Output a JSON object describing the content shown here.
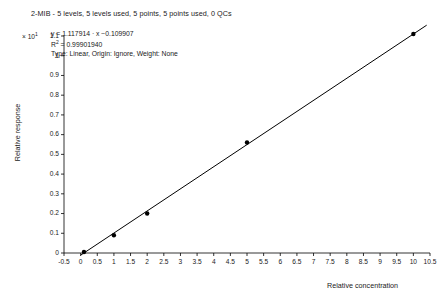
{
  "chart_data": {
    "type": "scatter",
    "title": "2-MIB - 5 levels, 5 levels used, 5 points, 5 points used, 0 QCs",
    "xlabel": "Relative concentration",
    "ylabel": "Relative response",
    "xlim": [
      -0.5,
      10.5
    ],
    "ylim": [
      0,
      1.1
    ],
    "y_axis_multiplier": "× 10",
    "y_axis_multiplier_exponent": "1",
    "grid": false,
    "legend": false,
    "x_ticks": [
      "-0.5",
      "0",
      "0.5",
      "1",
      "1.5",
      "2",
      "2.5",
      "3",
      "3.5",
      "4",
      "4.5",
      "5",
      "5.5",
      "6",
      "6.5",
      "7",
      "7.5",
      "8",
      "8.5",
      "9",
      "9.5",
      "10",
      "10.5"
    ],
    "x_tick_values": [
      -0.5,
      0,
      0.5,
      1,
      1.5,
      2,
      2.5,
      3,
      3.5,
      4,
      4.5,
      5,
      5.5,
      6,
      6.5,
      7,
      7.5,
      8,
      8.5,
      9,
      9.5,
      10,
      10.5
    ],
    "y_ticks": [
      "0",
      "0.1",
      "0.2",
      "0.3",
      "0.4",
      "0.5",
      "0.6",
      "0.7",
      "0.8",
      "0.9",
      "1",
      "1.1"
    ],
    "y_tick_values": [
      0,
      0.1,
      0.2,
      0.3,
      0.4,
      0.5,
      0.6,
      0.7,
      0.8,
      0.9,
      1.0,
      1.1
    ],
    "x": [
      0.1,
      1.0,
      2.0,
      5.0,
      10.0
    ],
    "y": [
      0.005,
      0.09,
      0.2,
      0.56,
      1.11
    ],
    "points": [
      {
        "x": 0.1,
        "y": 0.005
      },
      {
        "x": 1.0,
        "y": 0.09
      },
      {
        "x": 2.0,
        "y": 0.2
      },
      {
        "x": 5.0,
        "y": 0.56
      },
      {
        "x": 10.0,
        "y": 1.11
      }
    ],
    "fit_line": {
      "slope": 1.117914,
      "intercept": -0.109907,
      "x_start": 0.0,
      "x_end": 10.4
    },
    "annotations": {
      "equation": "y = 1.117914 · x −0.109907",
      "r_squared_label": "R",
      "r_squared_exponent": "2",
      "r_squared_value": " = 0.99901940",
      "fit_info": "Type: Linear, Origin: Ignore, Weight: None"
    },
    "colors": {
      "axis": "#000000",
      "line": "#000000",
      "marker": "#000000",
      "background": "#ffffff",
      "text": "#1a1a1a"
    }
  }
}
